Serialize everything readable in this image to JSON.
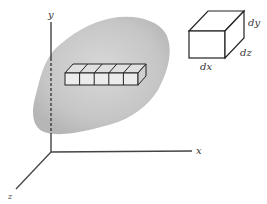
{
  "diagram": {
    "axes": {
      "x_label": "x",
      "y_label": "y",
      "z_label": "z"
    },
    "element_cube": {
      "dx_label": "dx",
      "dy_label": "dy",
      "dz_label": "dz"
    },
    "body": {
      "description": "shaded irregular solid region",
      "fill_color": "#c4c4c4"
    },
    "element_bar": {
      "cube_count": 5
    }
  }
}
